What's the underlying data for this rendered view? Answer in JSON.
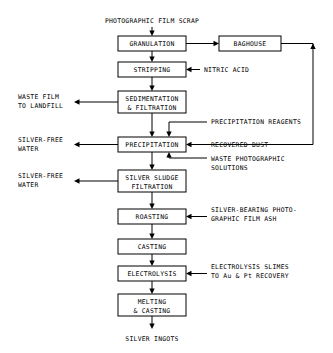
{
  "diagram": {
    "title": "PHOTOGRAPHIC FILM SCRAP",
    "output": "SILVER INGOTS",
    "process_boxes": [
      {
        "id": "granulation",
        "label": "GRANULATION",
        "x": 118,
        "y": 36,
        "w": 68,
        "h": 15,
        "lines": [
          "GRANULATION"
        ]
      },
      {
        "id": "baghouse",
        "label": "BAGHOUSE",
        "x": 219,
        "y": 36,
        "w": 62,
        "h": 15,
        "lines": [
          "BAGHOUSE"
        ]
      },
      {
        "id": "stripping",
        "label": "STRIPPING",
        "x": 118,
        "y": 62,
        "w": 68,
        "h": 15,
        "lines": [
          "STRIPPING"
        ]
      },
      {
        "id": "sedimentation-filtration",
        "label": "SEDIMENTATION & FILTRATION",
        "x": 118,
        "y": 91,
        "w": 68,
        "h": 22,
        "lines": [
          "SEDIMENTATION",
          "& FILTRATION"
        ]
      },
      {
        "id": "precipitation",
        "label": "PRECIPITATION",
        "x": 118,
        "y": 137,
        "w": 68,
        "h": 15,
        "lines": [
          "PRECIPITATION"
        ]
      },
      {
        "id": "silver-sludge-filtration",
        "label": "SILVER SLUDGE FILTRATION",
        "x": 118,
        "y": 170,
        "w": 68,
        "h": 22,
        "lines": [
          "SILVER SLUDGE",
          "FILTRATION"
        ]
      },
      {
        "id": "roasting",
        "label": "ROASTING",
        "x": 118,
        "y": 209,
        "w": 68,
        "h": 15,
        "lines": [
          "ROASTING"
        ]
      },
      {
        "id": "casting",
        "label": "CASTING",
        "x": 118,
        "y": 239,
        "w": 68,
        "h": 15,
        "lines": [
          "CASTING"
        ]
      },
      {
        "id": "electrolysis",
        "label": "ELECTROLYSIS",
        "x": 118,
        "y": 266,
        "w": 68,
        "h": 15,
        "lines": [
          "ELECTROLYSIS"
        ]
      },
      {
        "id": "melting-casting",
        "label": "MELTING & CASTING",
        "x": 118,
        "y": 294,
        "w": 68,
        "h": 22,
        "lines": [
          "MELTING",
          "& CASTING"
        ]
      }
    ],
    "input_labels": [
      {
        "id": "nitric-acid",
        "lines": [
          "NITRIC ACID"
        ],
        "x": 204,
        "y": 72
      },
      {
        "id": "precipitation-reagents",
        "lines": [
          "PRECIPITATION REAGENTS"
        ],
        "x": 211,
        "y": 124
      },
      {
        "id": "recovered-dust",
        "lines": [
          "RECOVERED DUST"
        ],
        "x": 211,
        "y": 141
      },
      {
        "id": "waste-photographic-solutions",
        "lines": [
          "WASTE PHOTOGRAPHIC",
          "SOLUTIONS"
        ],
        "x": 211,
        "y": 158
      },
      {
        "id": "silver-bearing-film-ash",
        "lines": [
          "SILVER-BEARING PHOTO-",
          "GRAPHIC FILM ASH"
        ],
        "x": 211,
        "y": 212
      },
      {
        "id": "electrolysis-slimes",
        "lines": [
          "ELECTROLYSIS SLIMES",
          "TO Au & Pt RECOVERY"
        ],
        "x": 211,
        "y": 269
      }
    ],
    "output_labels": [
      {
        "id": "waste-film-to-landfill",
        "lines": [
          "WASTE FILM",
          "TO LANDFILL"
        ],
        "x": 18,
        "y": 98
      },
      {
        "id": "silver-free-water-precipitation",
        "lines": [
          "SILVER-FREE",
          "WATER"
        ],
        "x": 18,
        "y": 141
      },
      {
        "id": "silver-free-water-filtration",
        "lines": [
          "SILVER-FREE",
          "WATER"
        ],
        "x": 18,
        "y": 177
      }
    ]
  }
}
